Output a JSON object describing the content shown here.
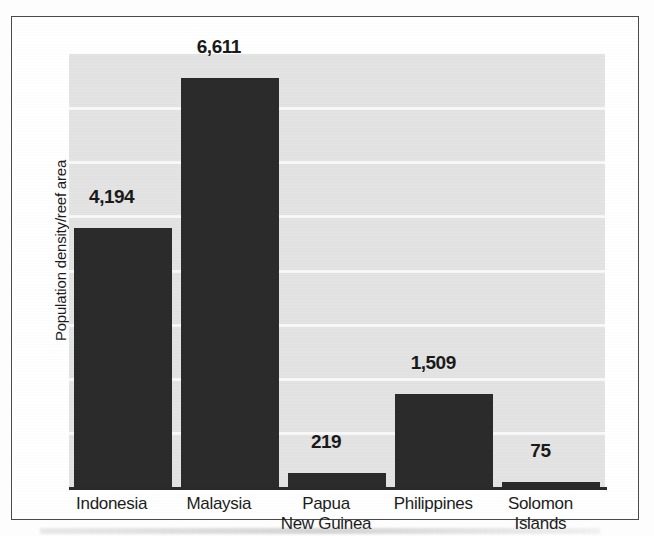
{
  "chart_data": {
    "type": "bar",
    "title": "",
    "xlabel": "",
    "ylabel": "Population density/reef area",
    "categories": [
      "Indonesia",
      "Malaysia",
      "Papua New Guinea",
      "Philippines",
      "Solomon Islands"
    ],
    "category_lines": [
      [
        "Indonesia"
      ],
      [
        "Malaysia"
      ],
      [
        "Papua",
        "New Guinea"
      ],
      [
        "Philippines"
      ],
      [
        "Solomon",
        "Islands"
      ]
    ],
    "values": [
      4194,
      6611,
      219,
      1509,
      75
    ],
    "value_labels": [
      "4,194",
      "6,611",
      "219",
      "1,509",
      "75"
    ],
    "ylim": [
      0,
      7000
    ],
    "grid": true,
    "gridlines_count": 7,
    "legend": "none",
    "bar_color": "#2b2b2b",
    "plot_background": "#e3e3e3",
    "gridline_color": "#f8f8f8",
    "axis_color": "#2a2a2a",
    "text_color": "#1c1c1c"
  }
}
